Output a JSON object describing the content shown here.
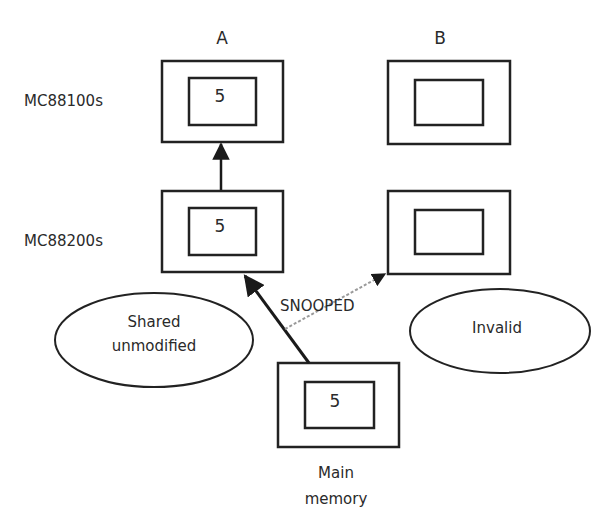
{
  "columns": {
    "a": "A",
    "b": "B"
  },
  "rows": {
    "top": "MC88100s",
    "mid": "MC88200s"
  },
  "values": {
    "a_top": "5",
    "a_mid": "5",
    "memory": "5"
  },
  "labels": {
    "snooped": "SNOOPED",
    "shared_line1": "Shared",
    "shared_line2": "unmodified",
    "invalid": "Invalid",
    "memory_line1": "Main",
    "memory_line2": "memory"
  },
  "colors": {
    "stroke": "#222222",
    "dashed": "#9a9a9a"
  }
}
